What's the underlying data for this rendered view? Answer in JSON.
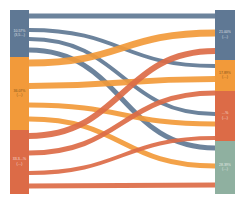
{
  "chart_data": {
    "type": "sankey",
    "title": "",
    "left_nodes": [
      {
        "id": "L1",
        "label": "10.57%",
        "sublabel": "(3,5…)",
        "color": "#5f7894",
        "y0": 10,
        "y1": 57
      },
      {
        "id": "L2",
        "label": "36.07%",
        "sublabel": "(…)",
        "color": "#f29a3a",
        "y0": 57,
        "y1": 130
      },
      {
        "id": "L3",
        "label": "33.3…%",
        "sublabel": "(…)",
        "color": "#dc6b47",
        "y0": 130,
        "y1": 194
      }
    ],
    "right_nodes": [
      {
        "id": "R1",
        "label": "21.00%",
        "sublabel": "(…)",
        "color": "#5f7894",
        "y0": 10,
        "y1": 60
      },
      {
        "id": "R2",
        "label": "17.89%",
        "sublabel": "(…)",
        "color": "#f29a3a",
        "y0": 60,
        "y1": 91
      },
      {
        "id": "R3",
        "label": "…%",
        "sublabel": "(…)",
        "color": "#dc6b47",
        "y0": 91,
        "y1": 141
      },
      {
        "id": "R4",
        "label": "28.39%",
        "sublabel": "(…)",
        "color": "#8fb0a0",
        "y0": 141,
        "y1": 194
      }
    ],
    "links": [
      {
        "source": "L1",
        "y_start": 16,
        "y_end": 16,
        "color": "#5f7894",
        "width": 5
      },
      {
        "source": "L1",
        "y_start": 30,
        "y_end": 66,
        "color": "#5f7894",
        "width": 4
      },
      {
        "source": "L1",
        "y_start": 39,
        "y_end": 114,
        "color": "#5f7894",
        "width": 4
      },
      {
        "source": "L1",
        "y_start": 50,
        "y_end": 148,
        "color": "#5f7894",
        "width": 5
      },
      {
        "source": "L2",
        "y_start": 63,
        "y_end": 33,
        "color": "#f29a3a",
        "width": 7
      },
      {
        "source": "L2",
        "y_start": 86,
        "y_end": 79,
        "color": "#f29a3a",
        "width": 6
      },
      {
        "source": "L2",
        "y_start": 105,
        "y_end": 124,
        "color": "#f29a3a",
        "width": 5
      },
      {
        "source": "L2",
        "y_start": 119,
        "y_end": 166,
        "color": "#f29a3a",
        "width": 5
      },
      {
        "source": "L3",
        "y_start": 136,
        "y_end": 51,
        "color": "#dc6b47",
        "width": 6
      },
      {
        "source": "L3",
        "y_start": 153,
        "y_end": 93,
        "color": "#dc6b47",
        "width": 5
      },
      {
        "source": "L3",
        "y_start": 173,
        "y_end": 138,
        "color": "#dc6b47",
        "width": 4
      },
      {
        "source": "L3",
        "y_start": 186,
        "y_end": 185,
        "color": "#dc6b47",
        "width": 5
      }
    ],
    "layout": {
      "left_x0": 10,
      "left_x1": 29,
      "right_x0": 215,
      "right_x1": 235
    }
  }
}
